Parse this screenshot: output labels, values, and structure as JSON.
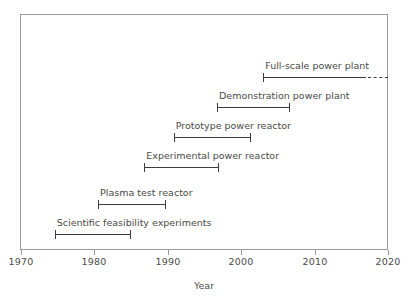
{
  "chart_data": {
    "type": "bar",
    "title": "",
    "subtitle": "",
    "xlabel": "Year",
    "ylabel": "",
    "xlim": [
      1970,
      2020
    ],
    "grid": false,
    "legend": null,
    "orientation": "horizontal-timeline",
    "xticks": [
      1970,
      1980,
      1990,
      2000,
      2010,
      2020
    ],
    "xtick_labels": [
      "1970",
      "1980",
      "1990",
      "2000",
      "2010",
      "2020"
    ],
    "categories": [
      "Full-scale power plant",
      "Demonstration power plant",
      "Prototype power reactor",
      "Experimental power reactor",
      "Plasma test reactor",
      "Scientific feasibility experiments"
    ],
    "bars": [
      {
        "label": "Full-scale power plant",
        "start": 2003,
        "end": 2017,
        "solid_end": 2017,
        "dashed_end": 2020,
        "open_ended": true,
        "start_cap": true,
        "end_cap": false
      },
      {
        "label": "Demonstration power plant",
        "start": 1996.7,
        "end": 2006.5,
        "solid_end": 2006.5,
        "dashed_end": null,
        "open_ended": false,
        "start_cap": true,
        "end_cap": true
      },
      {
        "label": "Prototype power reactor",
        "start": 1990.8,
        "end": 2001.2,
        "solid_end": 2001.2,
        "dashed_end": null,
        "open_ended": false,
        "start_cap": true,
        "end_cap": true
      },
      {
        "label": "Experimental power reactor",
        "start": 1986.8,
        "end": 1996.8,
        "solid_end": 1996.8,
        "dashed_end": null,
        "open_ended": false,
        "start_cap": true,
        "end_cap": true
      },
      {
        "label": "Plasma test reactor",
        "start": 1980.5,
        "end": 1989.6,
        "solid_end": 1989.6,
        "dashed_end": null,
        "open_ended": false,
        "start_cap": true,
        "end_cap": true
      },
      {
        "label": "Scientific feasibility experiments",
        "start": 1974.6,
        "end": 1984.9,
        "solid_end": 1984.9,
        "dashed_end": null,
        "open_ended": false,
        "start_cap": true,
        "end_cap": true
      }
    ],
    "colors": {
      "line": "#3c3c3c",
      "frame": "#9a9a9a",
      "text": "#4a4a4a",
      "background": "#ffffff"
    }
  },
  "layout": {
    "plot_left_px": 20,
    "plot_top_px": 14,
    "plot_width_px": 368,
    "plot_height_px": 236,
    "x_axis_y_px": 250,
    "bar_y_px": [
      77,
      107,
      137,
      167,
      204,
      234
    ]
  }
}
